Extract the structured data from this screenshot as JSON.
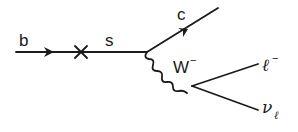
{
  "diagram": {
    "colors": {
      "ink": "#1a1a1a",
      "background": "#ffffff"
    },
    "particles": {
      "incoming": "b",
      "intermediate": "s",
      "outgoing_quark": "c",
      "boson": "W",
      "boson_charge": "−",
      "lepton": "ℓ",
      "lepton_charge": "−",
      "neutrino": "ν",
      "neutrino_subscript": "ℓ"
    },
    "vertex_marker": "×"
  }
}
